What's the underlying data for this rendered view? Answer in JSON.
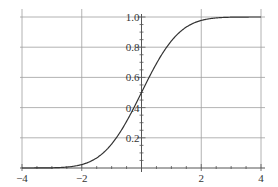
{
  "chart_data": {
    "type": "line",
    "title": "",
    "xlabel": "",
    "ylabel": "",
    "xlim": [
      -4,
      4
    ],
    "ylim": [
      0,
      1.0
    ],
    "grid": true,
    "legend": null,
    "x_ticks": [
      -4,
      -2,
      0,
      2,
      4
    ],
    "x_tick_labels": [
      "−4",
      "−2",
      "",
      "2",
      "4"
    ],
    "y_ticks": [
      0.2,
      0.4,
      0.6,
      0.8,
      1.0
    ],
    "y_tick_labels": [
      "0.2",
      "0.4",
      "0.6",
      "0.8",
      "1.0"
    ],
    "series": [
      {
        "name": "Standard normal CDF",
        "x": [
          -4,
          -3.5,
          -3,
          -2.5,
          -2,
          -1.5,
          -1,
          -0.5,
          0,
          0.5,
          1,
          1.5,
          2,
          2.5,
          3,
          3.5,
          4
        ],
        "values": [
          0.0,
          0.0002,
          0.0013,
          0.0062,
          0.0228,
          0.0668,
          0.1587,
          0.3085,
          0.5,
          0.6915,
          0.8413,
          0.9332,
          0.9772,
          0.9938,
          0.9987,
          0.9998,
          1.0
        ]
      }
    ]
  },
  "colors": {
    "curve": "#333333",
    "grid": "#a0a0a0",
    "axis": "#555555"
  }
}
